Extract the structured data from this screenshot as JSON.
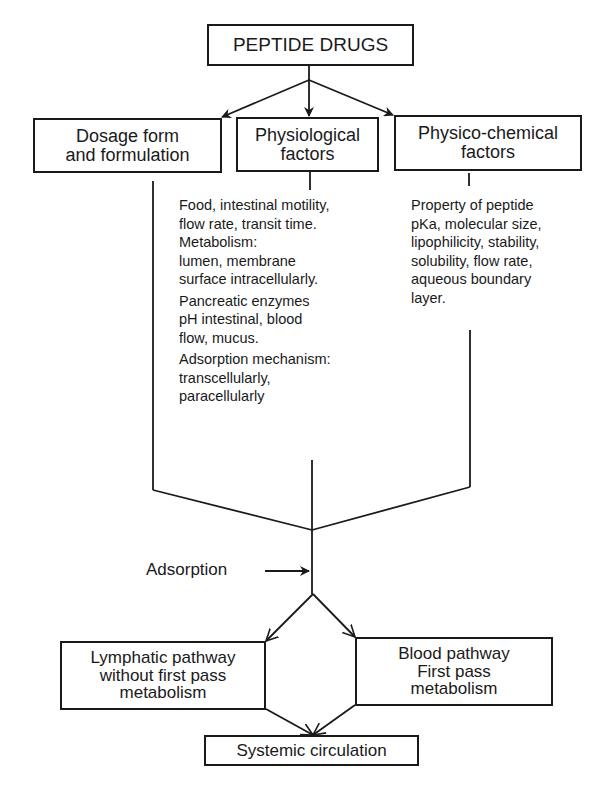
{
  "diagram": {
    "root": {
      "lines": [
        "PEPTIDE DRUGS"
      ]
    },
    "factors": [
      {
        "id": "dosage",
        "lines": [
          "Dosage form",
          "and formulation"
        ]
      },
      {
        "id": "physiological",
        "lines": [
          "Physiological",
          "factors"
        ]
      },
      {
        "id": "physicochemical",
        "lines": [
          "Physico-chemical",
          "factors"
        ]
      }
    ],
    "physiological_details": [
      [
        "Food, intestinal motility,",
        "flow rate, transit time.",
        "Metabolism:",
        "lumen, membrane",
        "surface intracellularly."
      ],
      [
        "Pancreatic enzymes",
        "pH intestinal, blood",
        "flow, mucus."
      ],
      [
        "Adsorption mechanism:",
        "transcellularly,",
        "paracellularly"
      ]
    ],
    "physicochemical_details": [
      "Property of peptide",
      "pKa, molecular size,",
      "lipophilicity, stability,",
      "solubility, flow rate,",
      "aqueous boundary",
      "layer."
    ],
    "process_label": "Adsorption",
    "pathways": [
      {
        "id": "lymphatic",
        "lines": [
          "Lymphatic pathway",
          "without first pass",
          "metabolism"
        ]
      },
      {
        "id": "blood",
        "lines": [
          "Blood pathway",
          "First pass",
          "metabolism"
        ]
      }
    ],
    "outcome": {
      "lines": [
        "Systemic circulation"
      ]
    },
    "colors": {
      "ink": "#1a1a1a",
      "background": "#ffffff"
    }
  }
}
